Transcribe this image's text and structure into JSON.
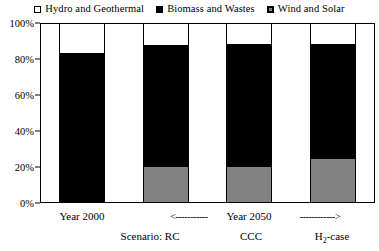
{
  "legend": {
    "position": "top",
    "entries": [
      {
        "label": "Hydro and Geothermal",
        "marker": "open-square-icon",
        "color": "#ffffff"
      },
      {
        "label": "Biomass and Wastes",
        "marker": "filled-square-icon",
        "color": "#000000"
      },
      {
        "label": "Wind and Solar",
        "marker": "gray-square-icon",
        "color": "#828282"
      }
    ]
  },
  "yaxis": {
    "ticks": [
      "0%",
      "20%",
      "40%",
      "60%",
      "80%",
      "100%"
    ],
    "min": 0,
    "max": 100
  },
  "xaxis": {
    "row_top": [
      {
        "text": "Year 2000",
        "kind": "label"
      },
      {
        "text": "<-----------",
        "kind": "arrow"
      },
      {
        "text": "Year 2050",
        "kind": "label"
      },
      {
        "text": "------------>",
        "kind": "arrow"
      }
    ],
    "row_bottom": [
      {
        "text": "Scenario: RC",
        "kind": "label"
      },
      {
        "text": "CCC",
        "kind": "label"
      },
      {
        "text": "H",
        "sub": "2",
        "tail": "-case",
        "kind": "label-sub"
      }
    ]
  },
  "chart_data": {
    "type": "bar",
    "subtype": "100% stacked column",
    "title": "",
    "xlabel": "",
    "ylabel": "",
    "ylim": [
      0,
      100
    ],
    "grid": false,
    "legend_position": "top",
    "categories": [
      "Year 2000",
      "Scenario: RC",
      "CCC",
      "H2-case"
    ],
    "series": [
      {
        "name": "Wind and Solar",
        "color": "#828282",
        "values": [
          0,
          20.5,
          20.0,
          24.5
        ]
      },
      {
        "name": "Biomass and Wastes",
        "color": "#000000",
        "values": [
          83.5,
          67.5,
          69.0,
          64.5
        ]
      },
      {
        "name": "Hydro and Geothermal",
        "color": "#ffffff",
        "values": [
          16.5,
          12.0,
          11.0,
          11.0
        ]
      }
    ],
    "cumulative_tops": {
      "wind_and_solar": [
        0,
        20.5,
        20.0,
        24.5
      ],
      "biomass_cumulative": [
        83.5,
        88.0,
        89.0,
        89.0
      ]
    }
  }
}
